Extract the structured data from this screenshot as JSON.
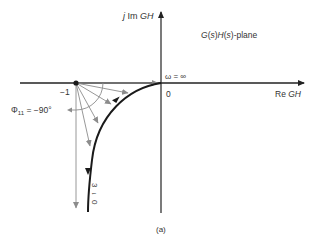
{
  "diagram": {
    "plane_label_parts": [
      "G",
      "(",
      "s",
      ")",
      "H",
      "(",
      "s",
      ")",
      "-plane"
    ],
    "imag_axis_label": {
      "prefix": "j ",
      "im": "Im ",
      "var": "GH"
    },
    "real_axis_label": {
      "re": "Re ",
      "var": "GH"
    },
    "origin_label": "0",
    "minus_one_label": "−1",
    "omega_inf_label": "ω = ∞",
    "phase_label": {
      "symbol": "Φ",
      "sub": "11",
      "value": " = −90°"
    },
    "omega_zero_label": [
      "3",
      "↓",
      "0"
    ],
    "caption": "(a)",
    "colors": {
      "axis": "#222222",
      "curve": "#1a1a1a",
      "vectors": "#8c8c8c",
      "text": "#333333"
    }
  }
}
